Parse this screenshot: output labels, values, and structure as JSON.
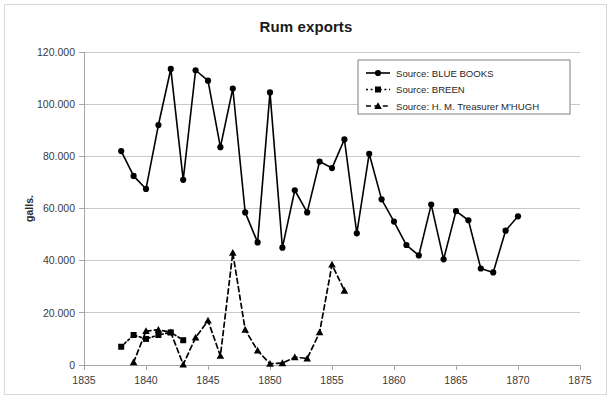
{
  "chart_data": {
    "type": "line",
    "title": "Rum exports",
    "xlabel": "",
    "ylabel": "galls.",
    "xlim": [
      1835,
      1875
    ],
    "ylim": [
      0,
      120000
    ],
    "xticks": [
      1835,
      1840,
      1845,
      1850,
      1855,
      1860,
      1865,
      1870,
      1875
    ],
    "xtick_labels": [
      "1835",
      "1840",
      "1845",
      "1850",
      "1855",
      "1860",
      "1865",
      "1870",
      "1875"
    ],
    "yticks": [
      0,
      20000,
      40000,
      60000,
      80000,
      100000,
      120000
    ],
    "ytick_labels": [
      "0",
      "20.000",
      "40.000",
      "60.000",
      "80.000",
      "100.000",
      "120.000"
    ],
    "grid": "horizontal",
    "legend_position": "top-right",
    "series": [
      {
        "name": "Source: BLUE BOOKS",
        "marker": "circle",
        "linestyle": "solid",
        "color": "#000000",
        "x": [
          1838,
          1839,
          1840,
          1841,
          1842,
          1843,
          1844,
          1845,
          1846,
          1847,
          1848,
          1849,
          1850,
          1851,
          1852,
          1853,
          1854,
          1855,
          1856,
          1857,
          1858,
          1859,
          1860,
          1861,
          1862,
          1863,
          1864,
          1865,
          1866,
          1867,
          1868,
          1869,
          1870
        ],
        "values": [
          82000,
          72500,
          67500,
          92000,
          113500,
          71000,
          113000,
          109000,
          83500,
          106000,
          58500,
          47000,
          104500,
          45000,
          67000,
          58500,
          78000,
          75500,
          86500,
          50500,
          81000,
          63500,
          55000,
          46000,
          42000,
          61500,
          40500,
          59000,
          55500,
          37000,
          35500,
          51500,
          57000
        ]
      },
      {
        "name": "Source: BREEN",
        "marker": "square",
        "linestyle": "dotted",
        "color": "#000000",
        "x": [
          1838,
          1839,
          1840,
          1841,
          1842,
          1843
        ],
        "values": [
          7000,
          11500,
          10000,
          11500,
          12500,
          9500
        ]
      },
      {
        "name": "Source: H. M. Treasurer M'HUGH",
        "marker": "triangle",
        "linestyle": "dashed",
        "color": "#000000",
        "x": [
          1839,
          1840,
          1841,
          1842,
          1843,
          1844,
          1845,
          1846,
          1847,
          1848,
          1849,
          1850,
          1851,
          1852,
          1853,
          1854,
          1855,
          1856
        ],
        "values": [
          1000,
          13000,
          13500,
          12500,
          200,
          10500,
          17000,
          3500,
          43000,
          13500,
          5500,
          500,
          700,
          3000,
          2500,
          12500,
          38500,
          28500
        ]
      }
    ]
  },
  "legend": {
    "entries": [
      {
        "label": "Source: BLUE BOOKS"
      },
      {
        "label": "Source: BREEN"
      },
      {
        "label": "Source: H. M. Treasurer M'HUGH"
      }
    ]
  }
}
